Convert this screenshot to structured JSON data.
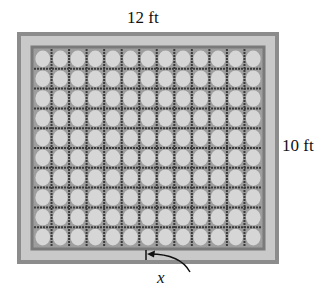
{
  "diagram": {
    "labels": {
      "width": "12 ft",
      "height": "10 ft",
      "border_width": "x"
    },
    "grid": {
      "columns": 13,
      "rows": 10
    },
    "colors": {
      "outer_border": "#8c8c8c",
      "border_fill": "#c9c9c9",
      "inner_frame": "#7a7a7a",
      "tile_bg": "#9e9e9e",
      "tile_circle": "#d6d6d6",
      "grid_line": "#3a3a3a",
      "text": "#111111"
    }
  }
}
